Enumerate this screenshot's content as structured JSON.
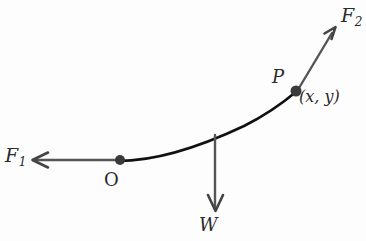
{
  "figure": {
    "name": "free-body-diagram-catenary",
    "background_color": "#fdfdfd",
    "width": 366,
    "height": 241
  },
  "labels": {
    "force_left": {
      "symbol": "F",
      "subscript": "1"
    },
    "force_right": {
      "symbol": "F",
      "subscript": "2"
    },
    "weight": "W",
    "origin": "O",
    "point": "P",
    "coordinates": "(x, y)"
  },
  "colors": {
    "curve": "#111111",
    "arrow_shaft": "#555555",
    "point_marker": "#3a3a3a",
    "text": "#2b2b2b"
  },
  "geometry": {
    "curve": {
      "type": "catenary-arc",
      "start": [
        118,
        161
      ],
      "end": [
        296,
        92
      ],
      "control_points": [
        [
          190,
          156
        ],
        [
          250,
          128
        ]
      ]
    },
    "origin_point": [
      120,
      160
    ],
    "tangent_point": [
      295,
      92
    ],
    "force_left_arrow": {
      "from": [
        120,
        160
      ],
      "to": [
        32,
        160
      ]
    },
    "force_right_arrow": {
      "from": [
        298,
        89
      ],
      "to": [
        336,
        28
      ]
    },
    "weight_arrow": {
      "from": [
        215,
        135
      ],
      "to": [
        215,
        212
      ]
    }
  }
}
